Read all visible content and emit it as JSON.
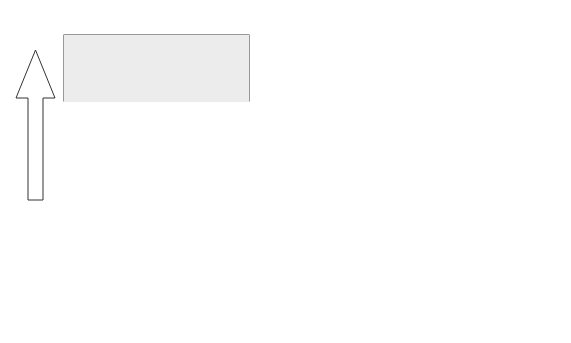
{
  "axis": {
    "y_label": "STANDARD FREE ENERGY",
    "x_label_a": "reaction coordinate",
    "x_label_b": "reaction coordinate"
  },
  "panel_a": {
    "caption": "(a)",
    "header_line1": "enol",
    "header_line2": "formation",
    "labels": {
      "ketone": "ketone",
      "protonated_line1": "protonated",
      "protonated_line2": "ketone",
      "enol": "enol"
    }
  },
  "panel_b": {
    "caption": "(b)",
    "header_left_line1": "enol",
    "header_left_line2": "formation",
    "header_right_line1": "enol",
    "header_right_line2": "halogenation",
    "labels": {
      "ketone_line1": "ketone",
      "ketone_line2": "+ Br₂",
      "protonated_line1": "protonated",
      "protonated_line2": "ketone + Br₂",
      "enol_line1": "enol",
      "enol_line2": "+ Br₂",
      "prot_bromo_line1": "protonated",
      "prot_bromo_line2": "α-bromo",
      "prot_bromo_line3": "ketone + Br⁻",
      "bromo_line1": "α-bromo",
      "bromo_line2": "ketone",
      "bromo_line3": "+ HBr"
    }
  },
  "colors": {
    "panel_fill": "#ececec",
    "stroke": "#111111"
  }
}
